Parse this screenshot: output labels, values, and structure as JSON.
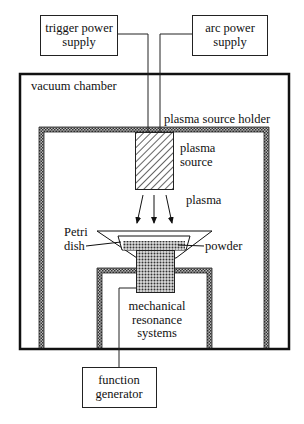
{
  "diagram": {
    "labels": {
      "trigger_line1": "trigger power",
      "trigger_line2": "supply",
      "arc_line1": "arc power",
      "arc_line2": "supply",
      "vacuum_chamber": "vacuum chamber",
      "holder": "plasma source holder",
      "source_line1": "plasma",
      "source_line2": "source",
      "plasma": "plasma",
      "petri_line1": "Petri",
      "petri_line2": "dish",
      "powder": "powder",
      "mech_line1": "mechanical",
      "mech_line2": "resonance",
      "mech_line3": "systems",
      "fg_line1": "function",
      "fg_line2": "generator"
    }
  }
}
